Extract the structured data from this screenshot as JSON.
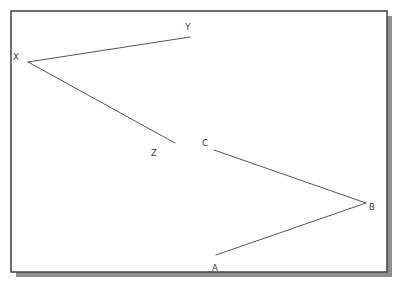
{
  "canvas": {
    "width": 402,
    "height": 288,
    "background_color": "#ffffff"
  },
  "frame": {
    "name": "diagram-frame",
    "x": 11,
    "y": 11,
    "width": 376,
    "height": 261,
    "border_color": "#4a4a4a",
    "border_width": 1.6,
    "fill_color": "#ffffff",
    "shadow": {
      "color": "#8e8e8e",
      "offset_x": 5,
      "offset_y": 5
    }
  },
  "style": {
    "line_color": "#555555",
    "line_width": 1,
    "label_color": "#3a3a3a",
    "label_font_size": 8.5
  },
  "diagram": {
    "figures": [
      {
        "name": "angle-yxz",
        "vertex": "X",
        "opens": "right",
        "points": [
          {
            "id": "Y",
            "x": 190,
            "y": 37,
            "label_x": 188,
            "label_y": 30
          },
          {
            "id": "X",
            "x": 28,
            "y": 62,
            "label_x": 16,
            "label_y": 60
          },
          {
            "id": "Z",
            "x": 175,
            "y": 143,
            "label_x": 154,
            "label_y": 156
          }
        ],
        "segments": [
          {
            "from": "X",
            "to": "Y"
          },
          {
            "from": "X",
            "to": "Z"
          }
        ]
      },
      {
        "name": "angle-cba",
        "vertex": "B",
        "opens": "left",
        "points": [
          {
            "id": "C",
            "x": 214,
            "y": 150,
            "label_x": 205,
            "label_y": 146
          },
          {
            "id": "B",
            "x": 366,
            "y": 203,
            "label_x": 370,
            "label_y": 210
          },
          {
            "id": "A",
            "x": 216,
            "y": 255,
            "label_x": 213,
            "label_y": 271
          }
        ],
        "segments": [
          {
            "from": "B",
            "to": "C"
          },
          {
            "from": "B",
            "to": "A"
          }
        ]
      }
    ],
    "labels": [
      {
        "id": "label-y",
        "text": "Y"
      },
      {
        "id": "label-x",
        "text": "X"
      },
      {
        "id": "label-z",
        "text": "Z"
      },
      {
        "id": "label-c",
        "text": "C"
      },
      {
        "id": "label-b",
        "text": "B"
      },
      {
        "id": "label-a",
        "text": "A"
      }
    ]
  }
}
